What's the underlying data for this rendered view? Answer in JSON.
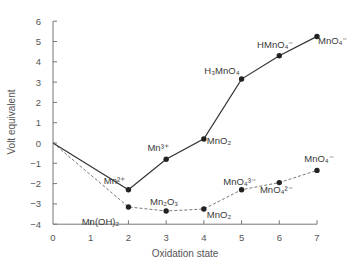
{
  "chart_data": {
    "type": "line",
    "title": "",
    "xlabel": "Oxidation state",
    "ylabel": "Volt equivalent",
    "xlim": [
      0,
      7
    ],
    "ylim": [
      -4,
      6
    ],
    "x_ticks": [
      0,
      1,
      2,
      3,
      4,
      5,
      6,
      7
    ],
    "y_ticks": [
      6,
      5,
      4,
      3,
      2,
      1,
      0,
      -1,
      -2,
      -3,
      -4
    ],
    "y_tick_labels": [
      "6",
      "5",
      "4",
      "3",
      "2",
      "1",
      "0",
      "−1",
      "−2",
      "−3",
      "−4"
    ],
    "grid": false,
    "legend": null,
    "series": [
      {
        "name": "Acidic solution",
        "style": "solid",
        "color": "#333333",
        "points": [
          {
            "x": 0,
            "y": 0,
            "label": ""
          },
          {
            "x": 2,
            "y": -2.3,
            "label": "Mn²⁺"
          },
          {
            "x": 3,
            "y": -0.8,
            "label": "Mn³⁺"
          },
          {
            "x": 4,
            "y": 0.2,
            "label": "MnO₂"
          },
          {
            "x": 5,
            "y": 3.15,
            "label": "H₃MnO₄"
          },
          {
            "x": 6,
            "y": 4.3,
            "label": "HMnO₄⁻"
          },
          {
            "x": 7,
            "y": 5.25,
            "label": "MnO₄⁻"
          }
        ]
      },
      {
        "name": "Basic solution",
        "style": "dashed",
        "color": "#555555",
        "points": [
          {
            "x": 0,
            "y": 0,
            "label": ""
          },
          {
            "x": 2,
            "y": -3.15,
            "label": "Mn(OH)₂"
          },
          {
            "x": 3,
            "y": -3.35,
            "label": "Mn₂O₃"
          },
          {
            "x": 4,
            "y": -3.25,
            "label": "MnO₂"
          },
          {
            "x": 5,
            "y": -2.3,
            "label": "MnO₄³⁻"
          },
          {
            "x": 6,
            "y": -1.95,
            "label": "MnO₄²⁻"
          },
          {
            "x": 7,
            "y": -1.35,
            "label": "MnO₄⁻"
          }
        ]
      }
    ],
    "annotations": []
  }
}
